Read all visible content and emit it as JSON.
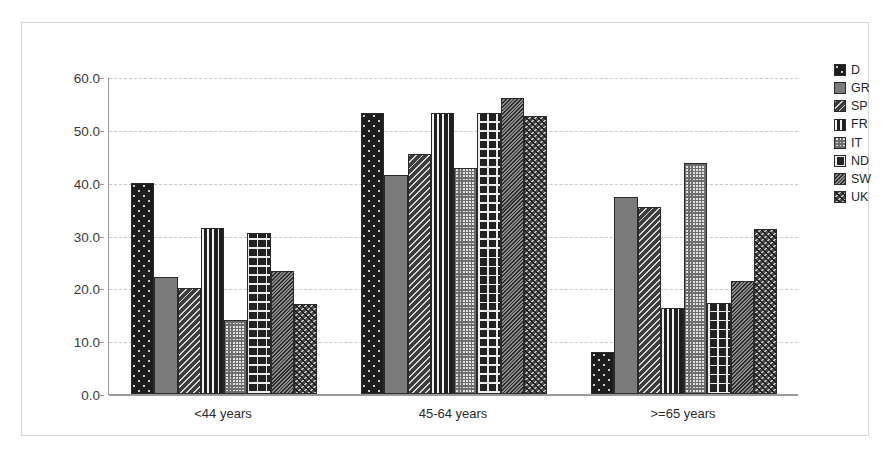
{
  "chart_data": {
    "type": "bar",
    "title": "",
    "subtitle": "",
    "xlabel": "",
    "ylabel": "",
    "categories": [
      "<44 years",
      "45-64 years",
      ">=65 years"
    ],
    "series": [
      {
        "name": "D",
        "pattern": "dark-dotted",
        "values": [
          40.0,
          53.2,
          8.0
        ]
      },
      {
        "name": "GR",
        "pattern": "solid-gray",
        "values": [
          22.2,
          41.5,
          37.3
        ]
      },
      {
        "name": "SP",
        "pattern": "diagonal-hatch",
        "values": [
          20.1,
          45.4,
          35.4
        ]
      },
      {
        "name": "FR",
        "pattern": "vertical-bars",
        "values": [
          31.4,
          53.2,
          16.3
        ]
      },
      {
        "name": "IT",
        "pattern": "light-checker",
        "values": [
          14.1,
          42.8,
          43.8
        ]
      },
      {
        "name": "ND",
        "pattern": "crosshatch-grid",
        "values": [
          30.5,
          53.2,
          17.3
        ]
      },
      {
        "name": "SW",
        "pattern": "dense-diagonal",
        "values": [
          23.2,
          56.1,
          21.4
        ]
      },
      {
        "name": "UK",
        "pattern": "zigzag-wave",
        "values": [
          17.0,
          52.6,
          31.3
        ]
      }
    ],
    "ylim": [
      0.0,
      60.0
    ],
    "yticks": [
      "0.0",
      "10.0",
      "20.0",
      "30.0",
      "40.0",
      "50.0",
      "60.0"
    ],
    "ytick_values": [
      0,
      10,
      20,
      30,
      40,
      50,
      60
    ],
    "grid": true,
    "grid_style": "dashed-horizontal",
    "legend_position": "right",
    "legend_entries": [
      "D",
      "GR",
      "SP",
      "FR",
      "IT",
      "ND",
      "SW",
      "UK"
    ],
    "colors": {
      "plot_background": "#ffffff",
      "frame_border": "#d6d6d6",
      "axis_line": "#9a9a9a",
      "gridline": "#c9c9c9",
      "tick_text": "#3a3a3a",
      "category_text": "#2b2b2b",
      "legend_text": "#1f1f1f"
    }
  }
}
